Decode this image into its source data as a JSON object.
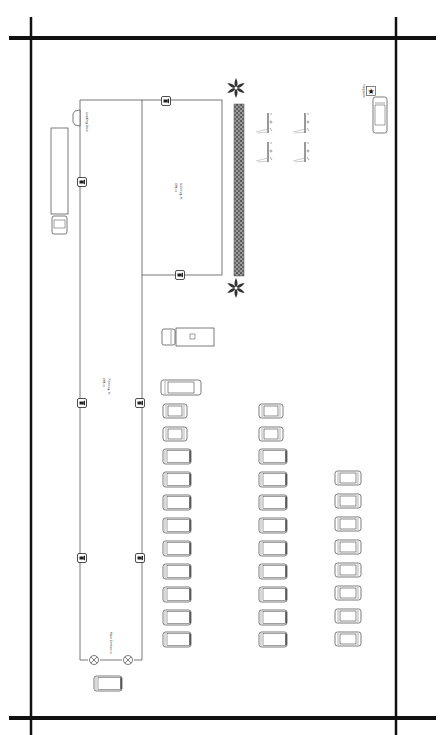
{
  "colors": {
    "border": "#111111",
    "wall": "#555555",
    "hedge": "#6a6a6a",
    "vehicle": "#444444",
    "background": "#ffffff"
  },
  "border": {
    "horizontal": [
      {
        "x1": 9,
        "x2": 436,
        "y": 38
      },
      {
        "x1": 9,
        "x2": 436,
        "y": 718
      }
    ],
    "vertical": [
      {
        "x": 31,
        "y1": 17,
        "y2": 735
      },
      {
        "x": 396,
        "y1": 17,
        "y2": 735
      }
    ]
  },
  "buildings": [
    {
      "name": "Office",
      "area": "5000 sq. ft.",
      "label_x": 176,
      "label_y": 190,
      "rect": {
        "x": 142,
        "y": 100,
        "w": 80,
        "h": 175
      }
    },
    {
      "name": "Office",
      "area": "7000 sq. ft.",
      "label_x": 104,
      "label_y": 385,
      "rect": {
        "x": 80,
        "y": 100,
        "w": 62,
        "h": 560
      }
    }
  ],
  "labels": {
    "loading_dock": "Loading Dock",
    "main_entrance": "Main Entrance",
    "flag_pole": "Flag pole"
  },
  "loading_dock": {
    "x": 70,
    "y": 110
  },
  "cameras": [
    {
      "x": 82,
      "y": 182
    },
    {
      "x": 166,
      "y": 101
    },
    {
      "x": 180,
      "y": 275
    },
    {
      "x": 82,
      "y": 403
    },
    {
      "x": 140,
      "y": 403
    },
    {
      "x": 82,
      "y": 558
    },
    {
      "x": 140,
      "y": 558
    }
  ],
  "entrance_lights": [
    {
      "x": 94,
      "y": 660
    },
    {
      "x": 128,
      "y": 660
    }
  ],
  "palms": [
    {
      "x": 236,
      "y": 88
    },
    {
      "x": 236,
      "y": 288
    }
  ],
  "hedge": {
    "x": 234,
    "y": 104,
    "w": 10,
    "h": 172
  },
  "light_poles": [
    {
      "x": 268,
      "y": 123
    },
    {
      "x": 305,
      "y": 123
    },
    {
      "x": 268,
      "y": 152
    },
    {
      "x": 305,
      "y": 152
    }
  ],
  "flag": {
    "x": 371,
    "y": 91
  },
  "trucks": [
    {
      "type": "semi",
      "x": 51,
      "y": 128,
      "w": 17,
      "h": 108
    },
    {
      "type": "box",
      "x": 162,
      "y": 328,
      "w": 52,
      "h": 18
    }
  ],
  "vehicles": [
    {
      "type": "limo",
      "x": 161,
      "y": 380,
      "w": 40,
      "h": 15
    },
    {
      "type": "car-v",
      "x": 373,
      "y": 97,
      "w": 14,
      "h": 36
    },
    {
      "type": "van-h",
      "x": 94,
      "y": 676,
      "w": 28,
      "h": 15
    },
    {
      "type": "car-h",
      "x": 163,
      "y": 404,
      "w": 24,
      "h": 14
    },
    {
      "type": "car-h",
      "x": 163,
      "y": 427,
      "w": 24,
      "h": 14
    },
    {
      "type": "van-h",
      "x": 163,
      "y": 449,
      "w": 28,
      "h": 15
    },
    {
      "type": "van-h",
      "x": 163,
      "y": 472,
      "w": 28,
      "h": 15
    },
    {
      "type": "van-h",
      "x": 163,
      "y": 495,
      "w": 28,
      "h": 15
    },
    {
      "type": "van-h",
      "x": 163,
      "y": 518,
      "w": 28,
      "h": 15
    },
    {
      "type": "van-h",
      "x": 163,
      "y": 541,
      "w": 28,
      "h": 15
    },
    {
      "type": "van-h",
      "x": 163,
      "y": 564,
      "w": 28,
      "h": 15
    },
    {
      "type": "van-h",
      "x": 163,
      "y": 587,
      "w": 28,
      "h": 15
    },
    {
      "type": "van-h",
      "x": 163,
      "y": 610,
      "w": 28,
      "h": 15
    },
    {
      "type": "van-h",
      "x": 163,
      "y": 632,
      "w": 28,
      "h": 15
    },
    {
      "type": "car-h",
      "x": 259,
      "y": 404,
      "w": 24,
      "h": 14
    },
    {
      "type": "car-h",
      "x": 259,
      "y": 427,
      "w": 24,
      "h": 14
    },
    {
      "type": "van-h",
      "x": 259,
      "y": 449,
      "w": 28,
      "h": 15
    },
    {
      "type": "van-h",
      "x": 259,
      "y": 472,
      "w": 28,
      "h": 15
    },
    {
      "type": "van-h",
      "x": 259,
      "y": 495,
      "w": 28,
      "h": 15
    },
    {
      "type": "van-h",
      "x": 259,
      "y": 518,
      "w": 28,
      "h": 15
    },
    {
      "type": "van-h",
      "x": 259,
      "y": 541,
      "w": 28,
      "h": 15
    },
    {
      "type": "van-h",
      "x": 259,
      "y": 564,
      "w": 28,
      "h": 15
    },
    {
      "type": "van-h",
      "x": 259,
      "y": 587,
      "w": 28,
      "h": 15
    },
    {
      "type": "van-h",
      "x": 259,
      "y": 610,
      "w": 28,
      "h": 15
    },
    {
      "type": "van-h",
      "x": 259,
      "y": 632,
      "w": 28,
      "h": 15
    },
    {
      "type": "car-h",
      "x": 335,
      "y": 471,
      "w": 26,
      "h": 14
    },
    {
      "type": "car-h",
      "x": 335,
      "y": 494,
      "w": 26,
      "h": 14
    },
    {
      "type": "car-h",
      "x": 335,
      "y": 517,
      "w": 26,
      "h": 14
    },
    {
      "type": "car-h",
      "x": 335,
      "y": 540,
      "w": 26,
      "h": 14
    },
    {
      "type": "car-h",
      "x": 335,
      "y": 563,
      "w": 26,
      "h": 14
    },
    {
      "type": "car-h",
      "x": 335,
      "y": 586,
      "w": 26,
      "h": 14
    },
    {
      "type": "car-h",
      "x": 335,
      "y": 609,
      "w": 26,
      "h": 14
    },
    {
      "type": "car-h",
      "x": 335,
      "y": 632,
      "w": 26,
      "h": 14
    }
  ]
}
